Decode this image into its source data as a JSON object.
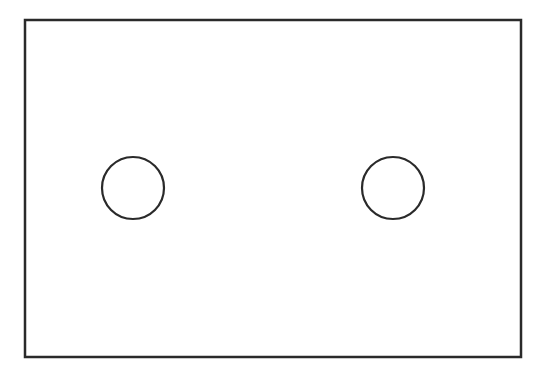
{
  "diagram": {
    "canvas": {
      "width": 542,
      "height": 370,
      "background": "#ffffff"
    },
    "stroke_color": "#2a2a2a",
    "rectangle": {
      "x": 25,
      "y": 20,
      "width": 496,
      "height": 337,
      "stroke_width": 2.5
    },
    "circles": [
      {
        "cx": 133,
        "cy": 188,
        "r": 31,
        "stroke_width": 2.2
      },
      {
        "cx": 393,
        "cy": 188,
        "r": 31,
        "stroke_width": 2.2
      }
    ]
  }
}
